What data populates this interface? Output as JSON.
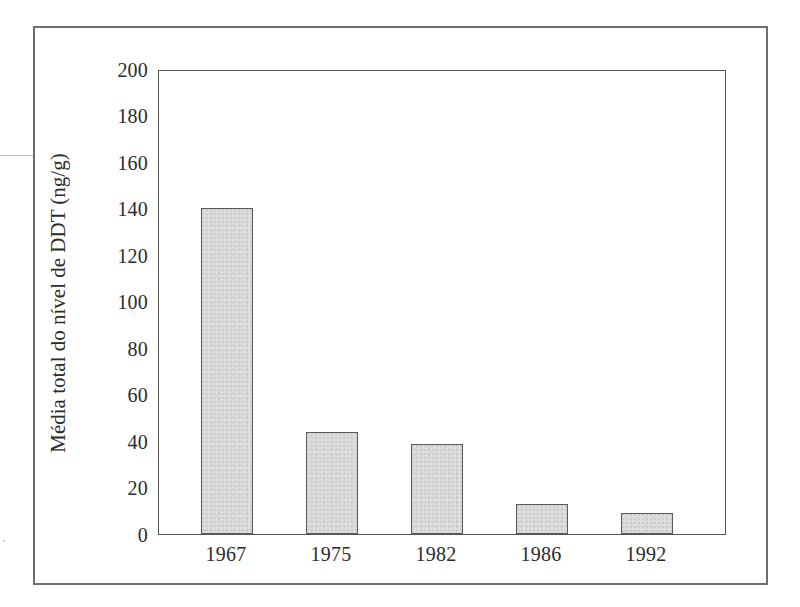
{
  "chart_data": {
    "type": "bar",
    "title": "",
    "subtitle": "",
    "xlabel": "",
    "ylabel": "Média total do nível de DDT (ng/g)",
    "categories": [
      "1967",
      "1975",
      "1982",
      "1986",
      "1992"
    ],
    "values": [
      141,
      44,
      39,
      13,
      9
    ],
    "series": [
      {
        "name": "Média total do nível de DDT",
        "values": [
          141,
          44,
          39,
          13,
          9
        ]
      }
    ],
    "ylim": [
      0,
      200
    ],
    "ytick_step": 20,
    "yticks": [
      "0",
      "20",
      "40",
      "60",
      "80",
      "100",
      "120",
      "140",
      "160",
      "180",
      "200"
    ],
    "xtick_labels": [
      "1967",
      "1975",
      "1982",
      "1986",
      "1992"
    ],
    "grid": false,
    "legend": false,
    "legend_position": "none",
    "bar_fill_color": "#dedede",
    "bar_edge_color": "#5a5a5a",
    "axis_color": "#555555",
    "frame_color": "#6d6d6d",
    "text_color": "#2b2b2b",
    "background_color": "#ffffff"
  },
  "figure": {
    "border_label": "figure-border"
  }
}
